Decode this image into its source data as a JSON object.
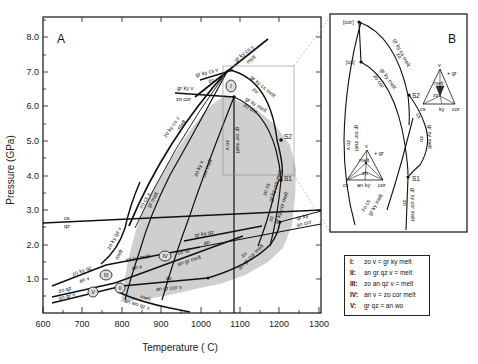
{
  "panel_a": {
    "label": "A",
    "x_axis": {
      "title": "Temperature ( C)",
      "ticks": [
        "600",
        "700",
        "800",
        "900",
        "1000",
        "1100",
        "1200",
        "1300"
      ]
    },
    "y_axis": {
      "title": "Pressure (GPa)",
      "ticks": [
        "1.0",
        "2.0",
        "3.0",
        "4.0",
        "5.0",
        "6.0",
        "7.0",
        "8.0"
      ]
    },
    "curve_labels": {
      "gr_ky_cs_v_top": "gr ky cs v",
      "melt_top": "melt",
      "gr_ky_cs_v_left": "gr ky cs v",
      "zo_left": "zo",
      "gr_ky_v": "gr ky v",
      "zo_cor": "zo cor",
      "zo_ky_cs_v": "zo ky cs v",
      "melt_along": "melt",
      "gr_ky_cs_melt": "gr ky cs melt",
      "zo_upper_right": "zo",
      "gr_ky_melt": "gr ky melt",
      "zo_cor_upper": "zo cor",
      "zo_v": "zo v",
      "gr_cor_melt": "gr cor melt",
      "zo_ky_v": "zo ky v",
      "cor_melt": "cor melt",
      "zo_cs_v": "zo cs v",
      "gr_melt": "gr melt",
      "cs": "cs",
      "qz": "qz",
      "zo_ky_qz_v": "zo ky qz v",
      "melt_qz": "melt",
      "zo_ky_qz": "zo ky qz",
      "an_v": "an v",
      "zo_qz": "zo qz",
      "an_gr_v": "an gr v",
      "zo_ky_melt": "zo ky melt",
      "an_v_2": "an v",
      "zo_qz_2": "zo qz",
      "an_gr_melt": "an gr melt",
      "gr_ky_qz": "gr ky qz",
      "an": "an",
      "zo_low": "zo",
      "an_gr_cor_v": "an gr cor v",
      "melt_low": "melt",
      "an_wo_qz_v": "an wo qz v",
      "zo_right": "zo",
      "an_gr_cor_melt": "an gr cor melt",
      "gr_ky": "gr ky",
      "an_cor": "an cor",
      "zo_cs": "zo cs",
      "gr_ky_cor_melt": "gr ky cor melt",
      "zo_r2": "zo",
      "gr_ky_cor_melt_2": "gr ky cor melt",
      "s1": "S1",
      "s2": "S2"
    },
    "invariant_points": [
      "I",
      "II",
      "III",
      "IV",
      "V"
    ]
  },
  "panel_b": {
    "label": "B",
    "labels": {
      "cor": "[cor]",
      "cs": "[cs]",
      "gr_ky_cs_melt": "gr ky cs melt",
      "zo_a": "zo",
      "gr_ky_melt": "gr ky melt",
      "zo_cor": "zo cor",
      "zo_v": "zo v",
      "gr_cor_melt": "gr cor melt",
      "s2": "S2",
      "s1": "S1",
      "cs_q": "cs",
      "zo_b": "zo",
      "gr_ky_melt_2": "gr ky melt",
      "zo_cs": "zo cs",
      "gr_ky_melt_3": "gr ky melt",
      "gr_ky_cor_melt": "gr ky cor melt",
      "zo_c": "zo"
    },
    "tri1": {
      "top": "v",
      "plus": "+ gr",
      "melt": "melt",
      "zo": "zo",
      "bl": "cs",
      "bm": "an ky",
      "br": "cor"
    },
    "tri2": {
      "top": "v",
      "plus": "+ gr",
      "melt": "melt",
      "zo": "zo",
      "bl": "cs",
      "bm": "ky",
      "br": "cor"
    }
  },
  "legend": {
    "rows": [
      {
        "key": "I:",
        "reaction": "zo v = gr ky melt"
      },
      {
        "key": "II:",
        "reaction": "an gr qz v = melt"
      },
      {
        "key": "III:",
        "reaction": "zo an qz v = melt"
      },
      {
        "key": "IV:",
        "reaction": "an v = zo cor melt"
      },
      {
        "key": "V:",
        "reaction": "gr qz = an wo"
      }
    ]
  }
}
